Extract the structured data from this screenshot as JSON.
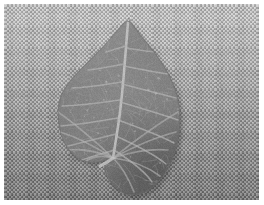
{
  "image": {
    "kind": "photograph",
    "subject": "leaf",
    "rendering": "grayscale",
    "width": 264,
    "height": 205,
    "border": {
      "color": "#ffffff",
      "top": 4,
      "right": 5,
      "bottom": 5,
      "left": 4
    }
  },
  "background": {
    "name": "woven-fabric-surface",
    "description": "finely woven textile with checkerboard weave pattern",
    "gradient_top_color": "#bcbcbc",
    "gradient_mid_color": "#9d9d9d",
    "gradient_bottom_color": "#7b7b7b",
    "weave": {
      "cell_size_px": 2.1,
      "light_color": "#c8c8c8",
      "dark_color": "#6e6e6e",
      "contrast": 0.42
    }
  },
  "leaf": {
    "name": "sagittate-leaf",
    "shape": "sagittate-cordate",
    "description": "arrowhead shaped leaf with sharp apex, narrow pointed left lobe and a broad rounded right lobe",
    "base_color": "#7a7a7a",
    "shadow_color": "#5f5f5f",
    "highlight_color": "#9a9a9a",
    "vein_color": "#b4b4b4",
    "midrib_color": "#c6c6c6",
    "edge_color": "#6a6a6a",
    "apex_point": {
      "x": 128,
      "y": 18
    },
    "left_lobe_tip": {
      "x": 58,
      "y": 100
    },
    "right_lobe_extent": {
      "x": 180,
      "y": 130
    },
    "bottom_extent": {
      "x": 148,
      "y": 196
    },
    "vein_origin": {
      "x": 113,
      "y": 158
    },
    "outline": [
      {
        "x": 128,
        "y": 18
      },
      {
        "x": 136,
        "y": 30
      },
      {
        "x": 148,
        "y": 44
      },
      {
        "x": 160,
        "y": 60
      },
      {
        "x": 170,
        "y": 76
      },
      {
        "x": 177,
        "y": 94
      },
      {
        "x": 180,
        "y": 112
      },
      {
        "x": 180,
        "y": 131
      },
      {
        "x": 176,
        "y": 150
      },
      {
        "x": 169,
        "y": 168
      },
      {
        "x": 158,
        "y": 183
      },
      {
        "x": 145,
        "y": 193
      },
      {
        "x": 131,
        "y": 196
      },
      {
        "x": 118,
        "y": 191
      },
      {
        "x": 109,
        "y": 181
      },
      {
        "x": 104,
        "y": 170
      },
      {
        "x": 106,
        "y": 162
      },
      {
        "x": 113,
        "y": 158
      },
      {
        "x": 104,
        "y": 161
      },
      {
        "x": 92,
        "y": 163
      },
      {
        "x": 79,
        "y": 160
      },
      {
        "x": 68,
        "y": 150
      },
      {
        "x": 61,
        "y": 136
      },
      {
        "x": 58,
        "y": 120
      },
      {
        "x": 58,
        "y": 104
      },
      {
        "x": 63,
        "y": 90
      },
      {
        "x": 74,
        "y": 76
      },
      {
        "x": 88,
        "y": 62
      },
      {
        "x": 103,
        "y": 47
      },
      {
        "x": 116,
        "y": 32
      }
    ],
    "veins": {
      "midrib": [
        {
          "x": 113,
          "y": 158
        },
        {
          "x": 118,
          "y": 128
        },
        {
          "x": 122,
          "y": 96
        },
        {
          "x": 125,
          "y": 60
        },
        {
          "x": 128,
          "y": 22
        }
      ],
      "secondary_count": 14,
      "right_lobe_rays": 6,
      "left_lobe_rays": 5
    },
    "petiole": {
      "name": "leaf-stem",
      "visible": true,
      "color": "#c0c0c0",
      "from": {
        "x": 113,
        "y": 158
      },
      "to": {
        "x": 100,
        "y": 166
      }
    }
  }
}
